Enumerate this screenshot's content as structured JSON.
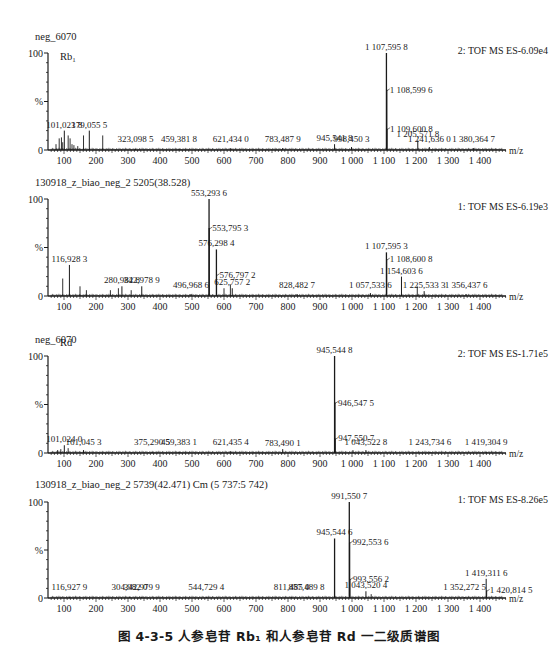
{
  "figure": {
    "caption": "图 4-3-5   人参皂苷 Rb₁ 和人参皂苷 Rd 一二级质谱图",
    "x_unit": "m/z",
    "y_tick_labels": [
      "100",
      "%",
      "0"
    ],
    "x_tick_labels": [
      "100",
      "200",
      "300",
      "400",
      "500",
      "600",
      "700",
      "800",
      "900",
      "1 000",
      "1 100",
      "1 200",
      "1 300",
      "1 400"
    ]
  },
  "chart_data": [
    {
      "type": "bar",
      "title": "neg_6070",
      "compound_label": "Rb₁",
      "instrument_label": "2: TOF MS ES-6.09e4",
      "xlabel": "m/z",
      "ylabel": "%",
      "xlim": [
        50,
        1480
      ],
      "ylim": [
        0,
        100
      ],
      "labeled_peaks": [
        {
          "mz": 101.0238,
          "label": "101,023 8",
          "intensity": 20
        },
        {
          "mz": 179.0555,
          "label": "179,055 5",
          "intensity": 20
        },
        {
          "mz": 323.0985,
          "label": "323,098 5",
          "intensity": 1
        },
        {
          "mz": 459.3818,
          "label": "459,381 8",
          "intensity": 1
        },
        {
          "mz": 621.434,
          "label": "621,434 0",
          "intensity": 2
        },
        {
          "mz": 783.4879,
          "label": "783,487 9",
          "intensity": 2
        },
        {
          "mz": 945.5418,
          "label": "945,541 8",
          "intensity": 6
        },
        {
          "mz": 998.4503,
          "label": "998,450 3",
          "intensity": 3
        },
        {
          "mz": 1107.5958,
          "label": "1 107,595 8",
          "intensity": 100
        },
        {
          "mz": 1108.5996,
          "label": "1 108,599 6",
          "intensity": 62
        },
        {
          "mz": 1109.6008,
          "label": "1 109,600 8",
          "intensity": 22
        },
        {
          "mz": 1205.5718,
          "label": "1 205,571 8",
          "intensity": 10
        },
        {
          "mz": 1241.636,
          "label": "1 241,636 0",
          "intensity": 3
        },
        {
          "mz": 1380.3647,
          "label": "1 380,364 7",
          "intensity": 2
        }
      ],
      "minor_peaks": [
        {
          "mz": 75,
          "intensity": 6
        },
        {
          "mz": 85,
          "intensity": 12
        },
        {
          "mz": 92,
          "intensity": 13
        },
        {
          "mz": 96,
          "intensity": 8
        },
        {
          "mz": 113,
          "intensity": 15
        },
        {
          "mz": 119,
          "intensity": 12
        },
        {
          "mz": 125,
          "intensity": 6
        },
        {
          "mz": 131,
          "intensity": 5
        },
        {
          "mz": 143,
          "intensity": 4
        },
        {
          "mz": 161,
          "intensity": 15
        },
        {
          "mz": 221,
          "intensity": 15
        }
      ]
    },
    {
      "type": "bar",
      "title": "130918_z_biao_neg_2 5205(38.528)",
      "compound_label": "",
      "instrument_label": "1: TOF MS ES-6.19e3",
      "xlabel": "m/z",
      "ylabel": "%",
      "xlim": [
        50,
        1480
      ],
      "ylim": [
        0,
        100
      ],
      "labeled_peaks": [
        {
          "mz": 116.9283,
          "label": "116,928 3",
          "intensity": 32
        },
        {
          "mz": 280.9828,
          "label": "280,982 8",
          "intensity": 10
        },
        {
          "mz": 342.9789,
          "label": "342,978 9",
          "intensity": 10
        },
        {
          "mz": 496.9686,
          "label": "496,968 6",
          "intensity": 2
        },
        {
          "mz": 553.2936,
          "label": "553,293 6",
          "intensity": 100
        },
        {
          "mz": 553.7953,
          "label": "553,795 3",
          "intensity": 70
        },
        {
          "mz": 576.2984,
          "label": "576,298 4",
          "intensity": 48
        },
        {
          "mz": 576.7972,
          "label": "576,797 2",
          "intensity": 22
        },
        {
          "mz": 625.7572,
          "label": "625,757 2",
          "intensity": 8
        },
        {
          "mz": 828.4827,
          "label": "828,482 7",
          "intensity": 2
        },
        {
          "mz": 1057.5336,
          "label": "1 057,533 6",
          "intensity": 3
        },
        {
          "mz": 1107.5953,
          "label": "1 107,595 3",
          "intensity": 45
        },
        {
          "mz": 1108.6008,
          "label": "1 108,600 8",
          "intensity": 38
        },
        {
          "mz": 1154.6036,
          "label": "1 154,603 6",
          "intensity": 20
        },
        {
          "mz": 1225.5333,
          "label": "1 225,533 3",
          "intensity": 5
        },
        {
          "mz": 1356.4376,
          "label": "1 356,437 6",
          "intensity": 2
        }
      ],
      "minor_peaks": [
        {
          "mz": 96,
          "intensity": 18
        },
        {
          "mz": 150,
          "intensity": 10
        },
        {
          "mz": 170,
          "intensity": 6
        },
        {
          "mz": 245,
          "intensity": 6
        },
        {
          "mz": 270,
          "intensity": 8
        },
        {
          "mz": 310,
          "intensity": 6
        },
        {
          "mz": 600,
          "intensity": 8
        },
        {
          "mz": 620,
          "intensity": 12
        },
        {
          "mz": 1204,
          "intensity": 10
        }
      ]
    },
    {
      "type": "bar",
      "title": "neg_6070",
      "compound_label": "Rd",
      "instrument_label": "2: TOF MS ES-1.71e5",
      "xlabel": "m/z",
      "ylabel": "%",
      "xlim": [
        50,
        1480
      ],
      "ylim": [
        0,
        100
      ],
      "labeled_peaks": [
        {
          "mz": 101.024,
          "label": "101,024 0",
          "intensity": 8
        },
        {
          "mz": 161.0453,
          "label": "161,045 3",
          "intensity": 3
        },
        {
          "mz": 375.2905,
          "label": "375,290 5",
          "intensity": 1
        },
        {
          "mz": 459.3831,
          "label": "459,383 1",
          "intensity": 1
        },
        {
          "mz": 621.4354,
          "label": "621,435 4",
          "intensity": 2
        },
        {
          "mz": 783.4901,
          "label": "783,490 1",
          "intensity": 4
        },
        {
          "mz": 945.5448,
          "label": "945,544 8",
          "intensity": 100
        },
        {
          "mz": 946.5475,
          "label": "946,547 5",
          "intensity": 52
        },
        {
          "mz": 947.5507,
          "label": "947,550 7",
          "intensity": 15
        },
        {
          "mz": 1043.5228,
          "label": "1 043,522 8",
          "intensity": 3
        },
        {
          "mz": 1243.7346,
          "label": "1 243,734 6",
          "intensity": 1
        },
        {
          "mz": 1419.3049,
          "label": "1 419,304 9",
          "intensity": 1
        }
      ],
      "minor_peaks": [
        {
          "mz": 80,
          "intensity": 3
        },
        {
          "mz": 90,
          "intensity": 4
        },
        {
          "mz": 113,
          "intensity": 5
        },
        {
          "mz": 1003,
          "intensity": 3
        }
      ]
    },
    {
      "type": "bar",
      "title": "130918_z_biao_neg_2 5739(42.471) Cm (5 737:5 742)",
      "compound_label": "",
      "instrument_label": "1: TOF MS ES-8.26e5",
      "xlabel": "m/z",
      "ylabel": "%",
      "xlim": [
        50,
        1480
      ],
      "ylim": [
        0,
        100
      ],
      "labeled_peaks": [
        {
          "mz": 116.9279,
          "label": "116,927 9",
          "intensity": 1
        },
        {
          "mz": 304.982,
          "label": "304,982 0",
          "intensity": 1
        },
        {
          "mz": 342.9799,
          "label": "342,979 9",
          "intensity": 1
        },
        {
          "mz": 544.7294,
          "label": "544,729 4",
          "intensity": 1
        },
        {
          "mz": 811.485,
          "label": "811,485 0",
          "intensity": 1
        },
        {
          "mz": 857.4898,
          "label": "857,489 8",
          "intensity": 1
        },
        {
          "mz": 945.5446,
          "label": "945,544 6",
          "intensity": 62
        },
        {
          "mz": 991.5507,
          "label": "991,550 7",
          "intensity": 100
        },
        {
          "mz": 992.5536,
          "label": "992,553 6",
          "intensity": 58
        },
        {
          "mz": 993.5562,
          "label": "993,556 2",
          "intensity": 20
        },
        {
          "mz": 1043.5204,
          "label": "1 043,520 4",
          "intensity": 7
        },
        {
          "mz": 1352.2725,
          "label": "1 352,272 5",
          "intensity": 1
        },
        {
          "mz": 1419.3116,
          "label": "1 419,311 6",
          "intensity": 20
        },
        {
          "mz": 1420.8145,
          "label": "1 420,814 5",
          "intensity": 8
        }
      ],
      "minor_peaks": [
        {
          "mz": 1060,
          "intensity": 4
        }
      ]
    }
  ]
}
